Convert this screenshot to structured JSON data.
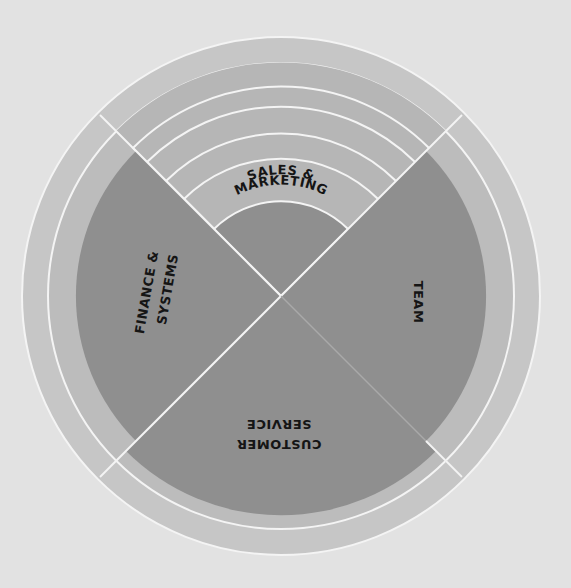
{
  "diagram": {
    "type": "radial-quadrant-diagram",
    "center": [
      281,
      296
    ],
    "colors": {
      "background": "#e2e2e2",
      "outer_ring": "#c6c6c6",
      "middle_ring": "#b8b8b8",
      "sector_fill": "#8f8f8f",
      "sales_band": "#b3b3b3",
      "sales_core": "#8f8f8f",
      "divider": "#f4f4f4",
      "text": "#151515"
    },
    "sectors": [
      {
        "id": "sales-marketing",
        "line1": "SALES &",
        "line2": "MARKETING"
      },
      {
        "id": "team",
        "line1": "TEAM"
      },
      {
        "id": "customer-service",
        "line1": "CUSTOMER",
        "line2": "SERVICE"
      },
      {
        "id": "finance-systems",
        "line1": "FINANCE &",
        "line2": "SYSTEMS"
      }
    ]
  }
}
